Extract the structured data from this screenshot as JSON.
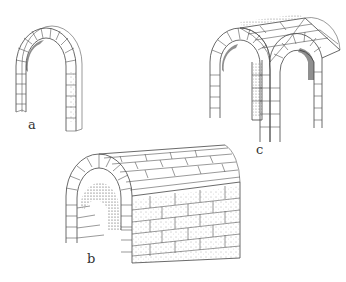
{
  "figure": {
    "background": "#ffffff",
    "line_color": "#555555",
    "panels": [
      {
        "id": "a",
        "label": "a",
        "description": "Single round (semicircular) arch built of voussoirs on two piers"
      },
      {
        "id": "b",
        "label": "b",
        "description": "Barrel vault (tunnel vault) of coursed masonry"
      },
      {
        "id": "c",
        "label": "c",
        "description": "Groin vault formed by two intersecting barrel vaults on four piers"
      }
    ]
  }
}
